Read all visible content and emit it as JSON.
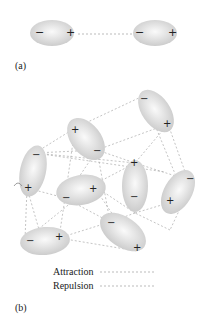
{
  "panel_a": {
    "label": "(a)",
    "molecules": [
      {
        "neg": "−",
        "pos": "+"
      },
      {
        "neg": "−",
        "pos": "+"
      }
    ]
  },
  "panel_b": {
    "label": "(b)",
    "molecule_count": 9
  },
  "legend": {
    "attraction": "Attraction",
    "repulsion": "Repulsion"
  },
  "colors": {
    "molecule_fill": "#d9d9d9",
    "line": "#aaaaaa",
    "text": "#222222"
  }
}
